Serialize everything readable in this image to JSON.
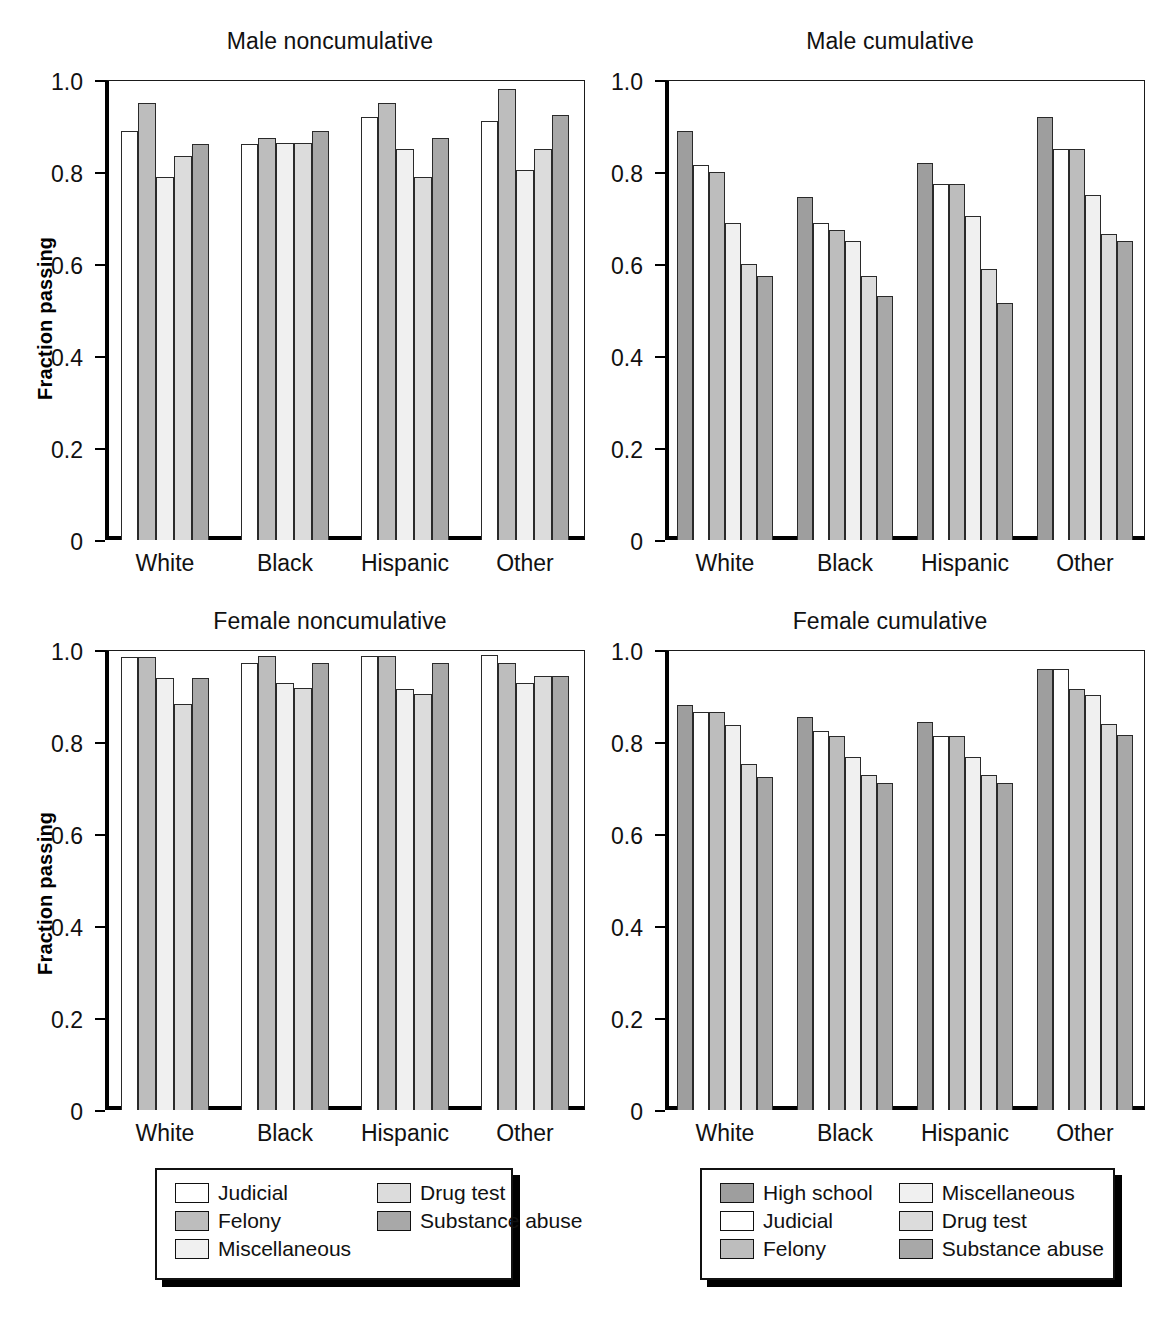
{
  "figure": {
    "ylabel": "Fraction passing",
    "categories": [
      "White",
      "Black",
      "Hispanic",
      "Other"
    ],
    "yticks": [
      "1.0",
      "0.8",
      "0.6",
      "0.4",
      "0.2",
      "0"
    ],
    "ytick_values": [
      1.0,
      0.8,
      0.6,
      0.4,
      0.2,
      0
    ],
    "ylim": [
      0,
      1.0
    ]
  },
  "colors": {
    "high_school": "#9e9e9e",
    "judicial": "#ffffff",
    "felony": "#bdbdbd",
    "miscellaneous": "#f0f0f0",
    "drug_test": "#dcdcdc",
    "substance_abuse": "#a8a8a8",
    "outline": "#2a2a2a",
    "axis": "#000000"
  },
  "legends": {
    "left": {
      "columns": 2,
      "items": [
        {
          "label": "Judicial",
          "color_key": "judicial"
        },
        {
          "label": "Felony",
          "color_key": "felony"
        },
        {
          "label": "Miscellaneous",
          "color_key": "miscellaneous"
        },
        {
          "label": "Drug test",
          "color_key": "drug_test"
        },
        {
          "label": "Substance abuse",
          "color_key": "substance_abuse"
        }
      ]
    },
    "right": {
      "columns": 2,
      "items": [
        {
          "label": "High school",
          "color_key": "high_school"
        },
        {
          "label": "Judicial",
          "color_key": "judicial"
        },
        {
          "label": "Felony",
          "color_key": "felony"
        },
        {
          "label": "Miscellaneous",
          "color_key": "miscellaneous"
        },
        {
          "label": "Drug test",
          "color_key": "drug_test"
        },
        {
          "label": "Substance abuse",
          "color_key": "substance_abuse"
        }
      ]
    }
  },
  "chart_data": [
    {
      "id": "male-noncumulative",
      "type": "bar",
      "title": "Male noncumulative",
      "xlabel": "",
      "ylabel": "Fraction passing",
      "ylim": [
        0,
        1.0
      ],
      "grid": false,
      "legend_position": "below-figure-left",
      "categories": [
        "White",
        "Black",
        "Hispanic",
        "Other"
      ],
      "series": [
        {
          "name": "Judicial",
          "color_key": "judicial",
          "values": [
            0.89,
            0.86,
            0.92,
            0.91
          ]
        },
        {
          "name": "Felony",
          "color_key": "felony",
          "values": [
            0.95,
            0.875,
            0.95,
            0.98
          ]
        },
        {
          "name": "Miscellaneous",
          "color_key": "miscellaneous",
          "values": [
            0.79,
            0.862,
            0.85,
            0.805
          ]
        },
        {
          "name": "Drug test",
          "color_key": "drug_test",
          "values": [
            0.835,
            0.862,
            0.79,
            0.85
          ]
        },
        {
          "name": "Substance abuse",
          "color_key": "substance_abuse",
          "values": [
            0.86,
            0.89,
            0.875,
            0.925
          ]
        }
      ]
    },
    {
      "id": "male-cumulative",
      "type": "bar",
      "title": "Male cumulative",
      "xlabel": "",
      "ylabel": "",
      "ylim": [
        0,
        1.0
      ],
      "grid": false,
      "legend_position": "below-figure-right",
      "categories": [
        "White",
        "Black",
        "Hispanic",
        "Other"
      ],
      "series": [
        {
          "name": "High school",
          "color_key": "high_school",
          "values": [
            0.89,
            0.745,
            0.82,
            0.92
          ]
        },
        {
          "name": "Judicial",
          "color_key": "judicial",
          "values": [
            0.815,
            0.69,
            0.775,
            0.85
          ]
        },
        {
          "name": "Felony",
          "color_key": "felony",
          "values": [
            0.8,
            0.675,
            0.775,
            0.85
          ]
        },
        {
          "name": "Miscellaneous",
          "color_key": "miscellaneous",
          "values": [
            0.69,
            0.65,
            0.705,
            0.75
          ]
        },
        {
          "name": "Drug test",
          "color_key": "drug_test",
          "values": [
            0.6,
            0.575,
            0.59,
            0.665
          ]
        },
        {
          "name": "Substance abuse",
          "color_key": "substance_abuse",
          "values": [
            0.575,
            0.53,
            0.515,
            0.65
          ]
        }
      ]
    },
    {
      "id": "female-noncumulative",
      "type": "bar",
      "title": "Female noncumulative",
      "xlabel": "",
      "ylabel": "Fraction passing",
      "ylim": [
        0,
        1.0
      ],
      "grid": false,
      "legend_position": "below-figure-left",
      "categories": [
        "White",
        "Black",
        "Hispanic",
        "Other"
      ],
      "series": [
        {
          "name": "Judicial",
          "color_key": "judicial",
          "values": [
            0.985,
            0.972,
            0.988,
            0.99
          ]
        },
        {
          "name": "Felony",
          "color_key": "felony",
          "values": [
            0.985,
            0.988,
            0.988,
            0.972
          ]
        },
        {
          "name": "Miscellaneous",
          "color_key": "miscellaneous",
          "values": [
            0.94,
            0.928,
            0.915,
            0.928
          ]
        },
        {
          "name": "Drug test",
          "color_key": "drug_test",
          "values": [
            0.882,
            0.918,
            0.905,
            0.944
          ]
        },
        {
          "name": "Substance abuse",
          "color_key": "substance_abuse",
          "values": [
            0.94,
            0.972,
            0.972,
            0.944
          ]
        }
      ]
    },
    {
      "id": "female-cumulative",
      "type": "bar",
      "title": "Female cumulative",
      "xlabel": "",
      "ylabel": "",
      "ylim": [
        0,
        1.0
      ],
      "grid": false,
      "legend_position": "below-figure-right",
      "categories": [
        "White",
        "Black",
        "Hispanic",
        "Other"
      ],
      "series": [
        {
          "name": "High school",
          "color_key": "high_school",
          "values": [
            0.88,
            0.855,
            0.843,
            0.958
          ]
        },
        {
          "name": "Judicial",
          "color_key": "judicial",
          "values": [
            0.865,
            0.825,
            0.813,
            0.958
          ]
        },
        {
          "name": "Felony",
          "color_key": "felony",
          "values": [
            0.865,
            0.813,
            0.813,
            0.915
          ]
        },
        {
          "name": "Miscellaneous",
          "color_key": "miscellaneous",
          "values": [
            0.838,
            0.768,
            0.768,
            0.903
          ]
        },
        {
          "name": "Drug test",
          "color_key": "drug_test",
          "values": [
            0.753,
            0.728,
            0.728,
            0.84
          ]
        },
        {
          "name": "Substance abuse",
          "color_key": "substance_abuse",
          "values": [
            0.725,
            0.71,
            0.71,
            0.815
          ]
        }
      ]
    }
  ]
}
